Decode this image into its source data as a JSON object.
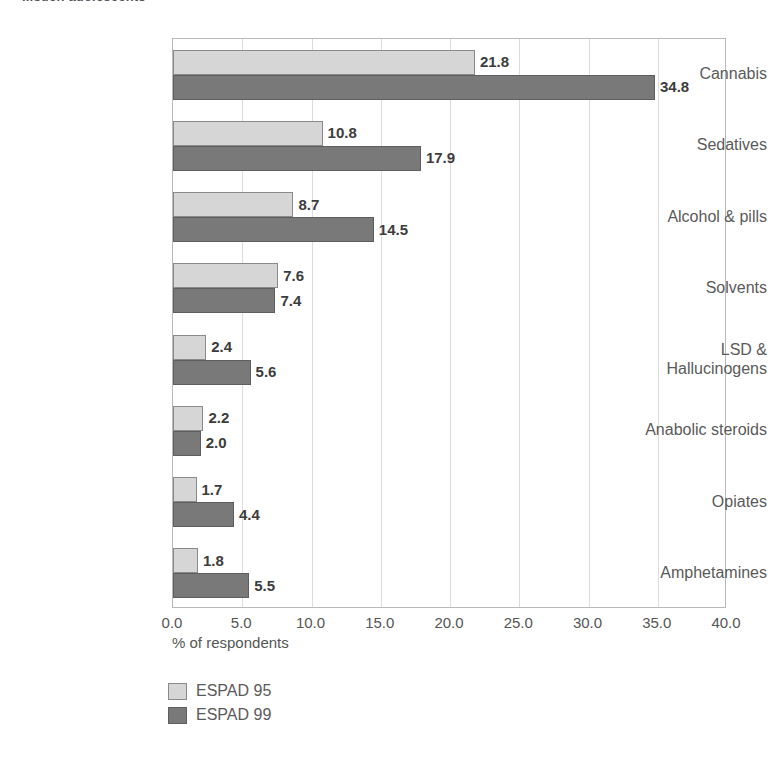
{
  "chart_data": {
    "type": "bar",
    "orientation": "horizontal",
    "title": "...such adolescents",
    "xlabel": "% of respondents",
    "ylabel": "",
    "xlim": [
      0,
      40
    ],
    "xticks": [
      "0.0",
      "5.0",
      "10.0",
      "15.0",
      "20.0",
      "25.0",
      "30.0",
      "35.0",
      "40.0"
    ],
    "xtick_values": [
      0,
      5,
      10,
      15,
      20,
      25,
      30,
      35,
      40
    ],
    "grid": true,
    "legend_position": "bottom-left",
    "categories": [
      "Cannabis",
      "Sedatives",
      "Alcohol & pills",
      "Solvents",
      "LSD &\nHallucinogens",
      "Anabolic steroids",
      "Opiates",
      "Amphetamines"
    ],
    "series": [
      {
        "name": "ESPAD 95",
        "color": "#d6d6d6",
        "values": [
          21.8,
          10.8,
          8.7,
          7.6,
          2.4,
          2.2,
          1.7,
          1.8
        ],
        "labels": [
          "21.8",
          "10.8",
          "8.7",
          "7.6",
          "2.4",
          "2.2",
          "1.7",
          "1.8"
        ]
      },
      {
        "name": "ESPAD 99",
        "color": "#797979",
        "values": [
          34.8,
          17.9,
          14.5,
          7.4,
          5.6,
          2.0,
          4.4,
          5.5
        ],
        "labels": [
          "34.8",
          "17.9",
          "14.5",
          "7.4",
          "5.6",
          "2.0",
          "4.4",
          "5.5"
        ]
      }
    ]
  }
}
